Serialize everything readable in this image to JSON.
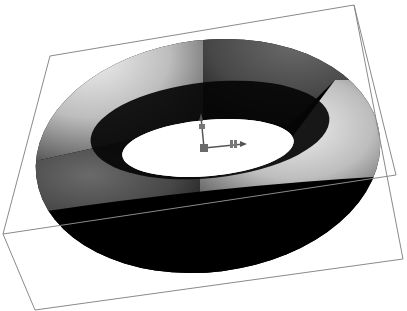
{
  "scene": {
    "label": "3D viewport — torus in bounding box",
    "background": "#ffffff",
    "object": {
      "type": "torus",
      "segments": [
        {
          "id": "back-left",
          "tone": "light",
          "color": "#c8c8c8"
        },
        {
          "id": "back-right",
          "tone": "dark",
          "color": "#4a4a4a"
        },
        {
          "id": "front-right",
          "tone": "light",
          "color": "#c8c8c8"
        },
        {
          "id": "front-left",
          "tone": "dark",
          "color": "#4a4a4a"
        }
      ],
      "shadow_color": "#000000"
    },
    "bounding_box": {
      "stroke": "#8a8a8a",
      "vertices": {
        "top_back_left": [
          50,
          56
        ],
        "top_back_right": [
          354,
          5
        ],
        "mid_right": [
          396,
          175
        ],
        "bottom_right": [
          403,
          259
        ],
        "front_left": [
          3,
          234
        ],
        "bottom_left": [
          35,
          310
        ]
      }
    },
    "gizmo": {
      "icon": "transform-axes-icon",
      "origin": [
        204,
        148
      ],
      "axes": [
        {
          "name": "y-axis",
          "to": [
            200,
            116
          ]
        },
        {
          "name": "x-axis",
          "to": [
            246,
            144
          ]
        }
      ],
      "color": "#555555"
    }
  }
}
